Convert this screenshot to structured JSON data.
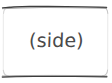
{
  "canvas": {
    "width": 112,
    "height": 83,
    "background_color": "#ffffff"
  },
  "diagram": {
    "type": "hand-drawn-annotation-box",
    "node": {
      "shape": "rounded-rectangle",
      "label": "(side)",
      "label_color": "#4a4a4a",
      "stroke_color": "#3a3a3a",
      "faint_stroke_color": "#e8e8e8",
      "fill_color": "#ffffff",
      "stroke_width": 1.4,
      "corner_radius": 7,
      "bounds": {
        "x": 2,
        "y": 6,
        "width": 106,
        "height": 71
      }
    }
  }
}
